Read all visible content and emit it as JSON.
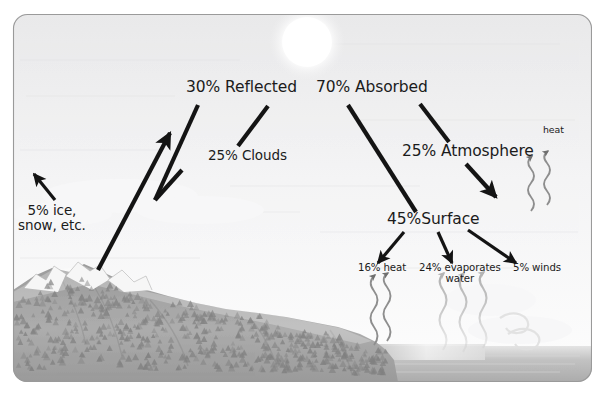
{
  "figure": {
    "kind": "earth-energy-budget-diagram",
    "frame": {
      "border_color": "#9a9a9a",
      "corner_radius": 14
    },
    "sun": {
      "name": "sun",
      "color": "#fbfbfb"
    },
    "sky": {
      "top_color": "#ececed",
      "bottom_color": "#fdfdfd"
    },
    "land": {
      "color": "#a9a9a9",
      "snow_color": "#f4f4f4",
      "tree_color": "#7d7d7d"
    },
    "water": {
      "color": "#b9b9b9"
    }
  },
  "labels": {
    "reflected": "30% Reflected",
    "clouds": "25% Clouds",
    "ice": "5% ice,\nsnow, etc.",
    "absorbed": "70% Absorbed",
    "atmosphere": "25% Atmosphere",
    "surface": "45%Surface",
    "heat_atm": "heat",
    "heat_surface": "16% heat",
    "evaporates": "24% evaporates\nwater",
    "winds": "5% winds"
  },
  "chart_data": {
    "type": "diagram",
    "nodes": [
      {
        "id": "reflected",
        "label": "30% Reflected",
        "value": 30
      },
      {
        "id": "clouds",
        "label": "25% Clouds",
        "value": 25
      },
      {
        "id": "ice",
        "label": "5% ice, snow, etc.",
        "value": 5
      },
      {
        "id": "absorbed",
        "label": "70% Absorbed",
        "value": 70
      },
      {
        "id": "atmosphere",
        "label": "25% Atmosphere",
        "value": 25
      },
      {
        "id": "surface",
        "label": "45%Surface",
        "value": 45
      },
      {
        "id": "heat",
        "label": "16% heat",
        "value": 16
      },
      {
        "id": "evaporates",
        "label": "24% evaporates water",
        "value": 24
      },
      {
        "id": "winds",
        "label": "5% winds",
        "value": 5
      }
    ],
    "edges": [
      {
        "from": "reflected",
        "to": "clouds"
      },
      {
        "from": "reflected",
        "to": "ice"
      },
      {
        "from": "absorbed",
        "to": "atmosphere"
      },
      {
        "from": "absorbed",
        "to": "surface"
      },
      {
        "from": "surface",
        "to": "heat"
      },
      {
        "from": "surface",
        "to": "evaporates"
      },
      {
        "from": "surface",
        "to": "winds"
      }
    ],
    "units": "percent of incoming solar energy"
  }
}
